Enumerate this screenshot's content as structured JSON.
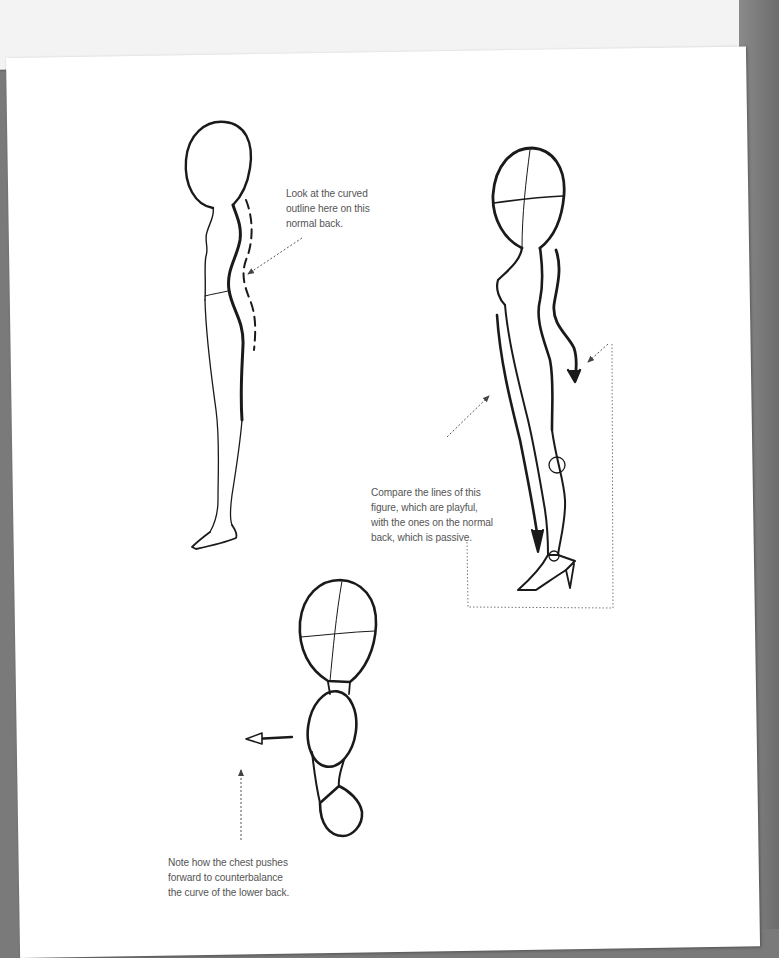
{
  "page": {
    "background_color": "#ffffff",
    "surround_color": "#7a7a7a",
    "ink_color": "#1a1a1a",
    "caption_color": "#555555"
  },
  "figures": [
    {
      "id": "normal-back-figure",
      "description": "Side-view figure with a normal back, outlined with a dashed curve"
    },
    {
      "id": "playful-figure",
      "description": "Side-view figure in heels with curved action arrows along the body"
    },
    {
      "id": "chest-torso-figure",
      "description": "Head and torso mannequin with the chest pushed forward, arrow pointing left"
    }
  ],
  "captions": {
    "normal_back": "Look at the curved\noutline here on this\nnormal back.",
    "compare_lines": "Compare the lines of this\nfigure, which are playful,\nwith the ones on the normal\nback, which is passive.",
    "chest_pushes": "Note how the chest pushes\nforward to counterbalance\nthe curve of the lower back."
  }
}
